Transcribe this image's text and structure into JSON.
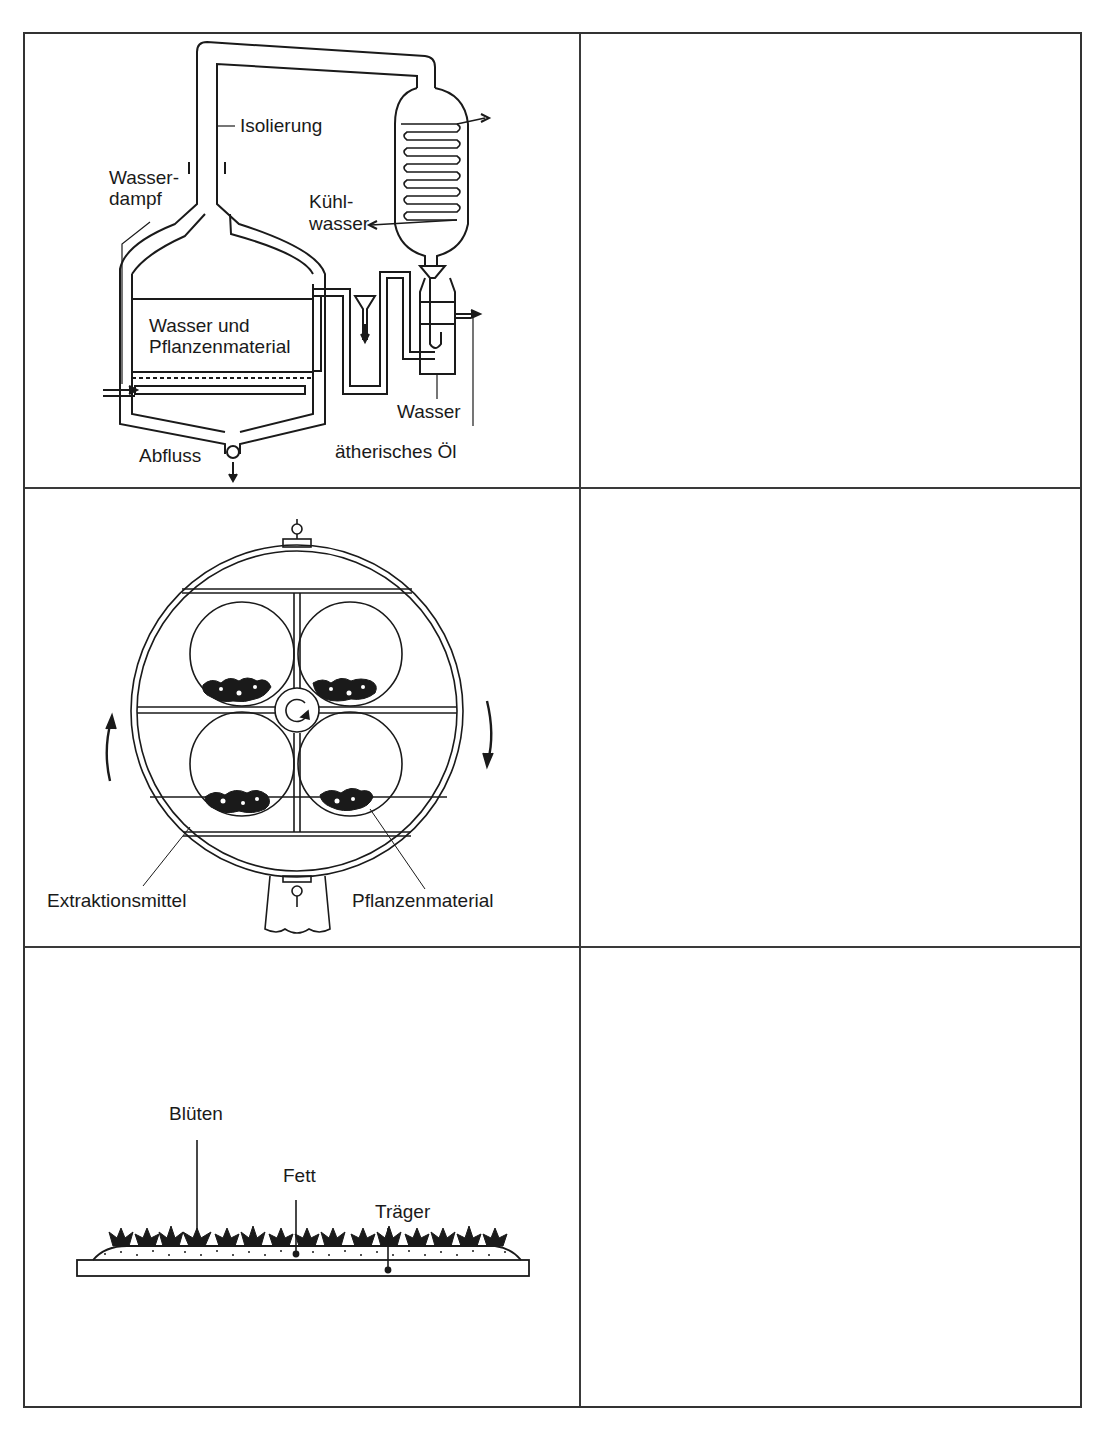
{
  "worksheet": {
    "layout": {
      "rows": 3,
      "columns": 2,
      "left_column": "diagrams",
      "right_column": "empty answer fields"
    },
    "rows": [
      {
        "diagram": "steam-distillation-apparatus",
        "labels": {
          "isolierung": "Isolierung",
          "wasserdampf_1": "Wasser-",
          "wasserdampf_2": "dampf",
          "kuehlwasser_1": "Kühl-",
          "kuehlwasser_2": "wasser",
          "wasser_pflanzen_1": "Wasser und",
          "wasser_pflanzen_2": "Pflanzenmaterial",
          "abfluss": "Abfluss",
          "wasser": "Wasser",
          "oel": "ätherisches Öl"
        },
        "answer": ""
      },
      {
        "diagram": "rotating-extraction-drum",
        "labels": {
          "extraktionsmittel": "Extraktionsmittel",
          "pflanzenmaterial": "Pflanzenmaterial"
        },
        "answer": ""
      },
      {
        "diagram": "enfleurage-tray",
        "labels": {
          "blueten": "Blüten",
          "fett": "Fett",
          "traeger": "Träger"
        },
        "answer": ""
      }
    ]
  },
  "colors": {
    "ink": "#1a1a1a",
    "grid": "#3a3a3a",
    "paper": "#ffffff"
  }
}
